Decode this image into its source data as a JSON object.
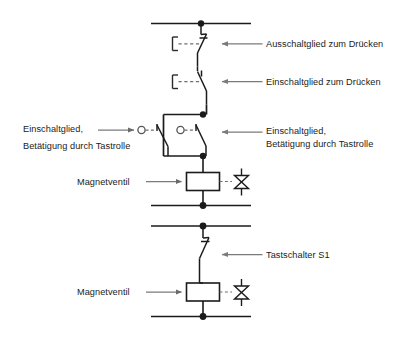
{
  "diagram": {
    "type": "electro-pneumatic-circuit-diagram",
    "background_color": "#ffffff",
    "line_color": "#1b1b1b",
    "text_color": "#1b1b1b",
    "dashed_color": "#6e6e6e",
    "arrow_color": "#7a7a7a"
  },
  "labels": {
    "nc_push": "Ausschaltglied zum Drücken",
    "no_push": "Einschaltglied zum Drücken",
    "roller_right_line1": "Einschaltglied,",
    "roller_right_line2": "Betätigung durch Tastrolle",
    "roller_left_line1": "Einschaltglied,",
    "roller_left_line2": "Betätigung durch Tastrolle",
    "solenoid_upper": "Magnetventil",
    "pushbutton_s1": "Tastschalter S1",
    "solenoid_lower": "Magnetventil"
  },
  "components": {
    "upper_circuit": {
      "supply_rail": "top-rail",
      "contacts": [
        {
          "name": "break-contact",
          "actuation": "push-button",
          "label_ref": "nc_push"
        },
        {
          "name": "make-contact",
          "actuation": "push-button",
          "label_ref": "no_push"
        },
        {
          "name": "make-contact-roller-left",
          "actuation": "roller-lever",
          "label_ref": "roller_left_line1"
        },
        {
          "name": "make-contact-roller-right",
          "actuation": "roller-lever",
          "label_ref": "roller_right_line1"
        }
      ],
      "load": {
        "name": "solenoid-coil",
        "label_ref": "solenoid_upper",
        "valve_symbol": "bowtie"
      },
      "return_rail": "mid-rail"
    },
    "lower_circuit": {
      "supply_rail": "lower-top-rail",
      "contacts": [
        {
          "name": "make-contact",
          "actuation": "push-button",
          "label_ref": "pushbutton_s1"
        }
      ],
      "load": {
        "name": "solenoid-coil",
        "label_ref": "solenoid_lower",
        "valve_symbol": "bowtie"
      },
      "return_rail": "bottom-rail"
    }
  }
}
